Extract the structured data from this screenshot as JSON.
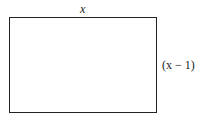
{
  "diagram": {
    "shape": "rectangle",
    "top_label": "x",
    "right_label": "(x − 1)"
  }
}
